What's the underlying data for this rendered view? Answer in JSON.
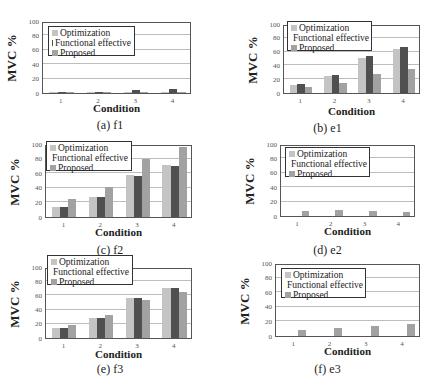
{
  "legend": [
    "Optimization",
    "Functional effective",
    "Proposed"
  ],
  "colors": {
    "Optimization": "#c4c4c4",
    "Functional effective": "#505050",
    "Proposed": "#a2a2a2"
  },
  "ylabel": "MVC %",
  "xlabel": "Condition",
  "yticks": [
    "0",
    "20",
    "40",
    "60",
    "80",
    "100"
  ],
  "xticks": [
    "1",
    "2",
    "3",
    "4"
  ],
  "chart_data": [
    {
      "type": "bar",
      "title": "(a) f1",
      "xlabel": "Condition",
      "ylabel": "MVC %",
      "ylim": [
        0,
        100
      ],
      "categories": [
        "1",
        "2",
        "3",
        "4"
      ],
      "series": [
        {
          "name": "Optimization",
          "values": [
            1,
            1,
            1,
            1
          ]
        },
        {
          "name": "Functional effective",
          "values": [
            1,
            2,
            4,
            5
          ]
        },
        {
          "name": "Proposed",
          "values": [
            1,
            1,
            1,
            1
          ]
        }
      ],
      "grid": true,
      "legend_position": "upper left"
    },
    {
      "type": "bar",
      "title": "(b) e1",
      "xlabel": "Condition",
      "ylabel": "MVC %",
      "ylim": [
        0,
        100
      ],
      "categories": [
        "1",
        "2",
        "3",
        "4"
      ],
      "series": [
        {
          "name": "Optimization",
          "values": [
            12,
            25,
            51,
            64
          ]
        },
        {
          "name": "Functional effective",
          "values": [
            13,
            26,
            53,
            66
          ]
        },
        {
          "name": "Proposed",
          "values": [
            9,
            15,
            27,
            35
          ]
        }
      ],
      "grid": true,
      "legend_position": "upper left"
    },
    {
      "type": "bar",
      "title": "(c) f2",
      "xlabel": "Condition",
      "ylabel": "MVC %",
      "ylim": [
        0,
        100
      ],
      "categories": [
        "1",
        "2",
        "3",
        "4"
      ],
      "series": [
        {
          "name": "Optimization",
          "values": [
            14,
            28,
            57,
            71
          ]
        },
        {
          "name": "Functional effective",
          "values": [
            14,
            28,
            56,
            70
          ]
        },
        {
          "name": "Proposed",
          "values": [
            24,
            41,
            79,
            96
          ]
        }
      ],
      "grid": true,
      "legend_position": "upper left"
    },
    {
      "type": "bar",
      "title": "(d) e2",
      "xlabel": "Condition",
      "ylabel": "MVC %",
      "ylim": [
        0,
        100
      ],
      "categories": [
        "1",
        "2",
        "3",
        "4"
      ],
      "series": [
        {
          "name": "Optimization",
          "values": [
            0,
            0,
            0,
            0
          ]
        },
        {
          "name": "Functional effective",
          "values": [
            0,
            0,
            0,
            0
          ]
        },
        {
          "name": "Proposed",
          "values": [
            7,
            8,
            7,
            6
          ]
        }
      ],
      "grid": true,
      "legend_position": "upper left"
    },
    {
      "type": "bar",
      "title": "(e) f3",
      "xlabel": "Condition",
      "ylabel": "MVC %",
      "ylim": [
        0,
        100
      ],
      "categories": [
        "1",
        "2",
        "3",
        "4"
      ],
      "series": [
        {
          "name": "Optimization",
          "values": [
            14,
            28,
            57,
            71
          ]
        },
        {
          "name": "Functional effective",
          "values": [
            14,
            28,
            56,
            70
          ]
        },
        {
          "name": "Proposed",
          "values": [
            19,
            33,
            53,
            65
          ]
        }
      ],
      "grid": true,
      "legend_position": "upper left"
    },
    {
      "type": "bar",
      "title": "(f) e3",
      "xlabel": "Condition",
      "ylabel": "MVC %",
      "ylim": [
        0,
        100
      ],
      "categories": [
        "1",
        "2",
        "3",
        "4"
      ],
      "series": [
        {
          "name": "Optimization",
          "values": [
            0,
            0,
            0,
            0
          ]
        },
        {
          "name": "Functional effective",
          "values": [
            0,
            0,
            0,
            0
          ]
        },
        {
          "name": "Proposed",
          "values": [
            8,
            11,
            14,
            17
          ]
        }
      ],
      "grid": true,
      "legend_position": "upper left"
    }
  ]
}
